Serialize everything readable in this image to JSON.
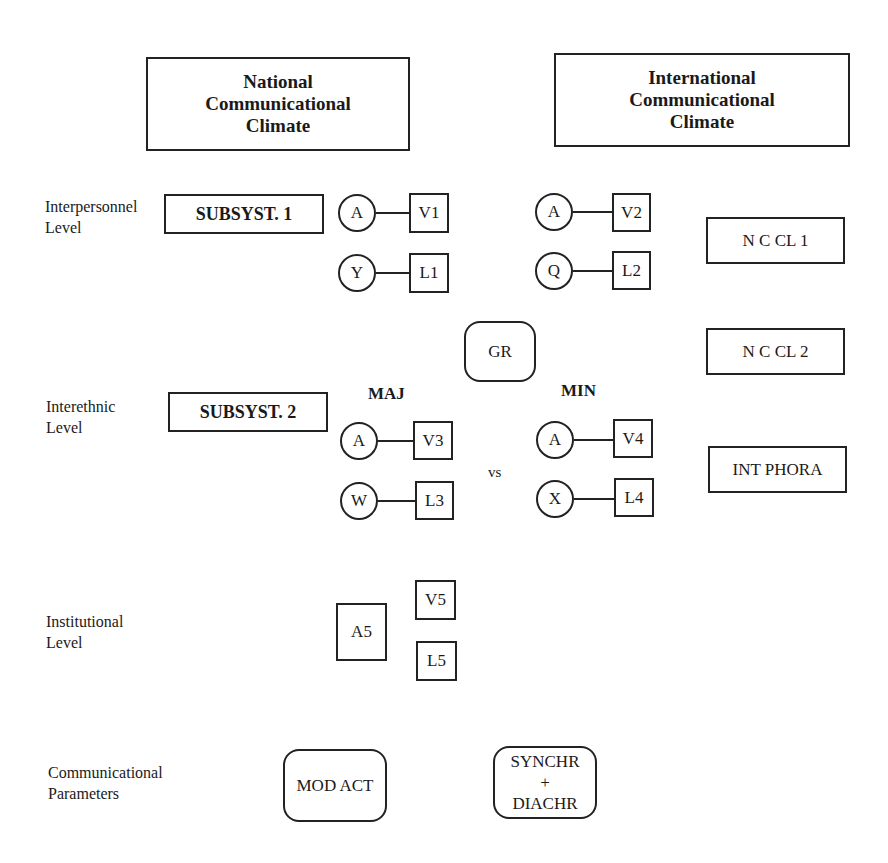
{
  "headers": {
    "national": "National\nCommunicational\nClimate",
    "international": "International\nCommunicational\nClimate"
  },
  "levels": {
    "interpersonnel": "Interpersonnel\nLevel",
    "interethnic": "Interethnic\nLevel",
    "institutional": "Institutional\nLevel",
    "communicational": "Communicational\nParameters"
  },
  "subsystems": {
    "subsyst1": "SUBSYST. 1",
    "subsyst2": "SUBSYST. 2"
  },
  "interpersonnel": {
    "national": [
      {
        "circle": "A",
        "box": "V1"
      },
      {
        "circle": "Y",
        "box": "L1"
      }
    ],
    "international": [
      {
        "circle": "A",
        "box": "V2"
      },
      {
        "circle": "Q",
        "box": "L2"
      }
    ]
  },
  "gr": "GR",
  "climate_boxes": {
    "ncl1": "N C CL 1",
    "ncl2": "N C CL 2",
    "intphora": "INT PHORA"
  },
  "interethnic": {
    "maj_label": "MAJ",
    "min_label": "MIN",
    "vs": "vs",
    "maj": [
      {
        "circle": "A",
        "box": "V3"
      },
      {
        "circle": "W",
        "box": "L3"
      }
    ],
    "min": [
      {
        "circle": "A",
        "box": "V4"
      },
      {
        "circle": "X",
        "box": "L4"
      }
    ]
  },
  "institutional": {
    "a5": "A5",
    "v5": "V5",
    "l5": "L5"
  },
  "parameters": {
    "mod_act": "MOD ACT",
    "synchr": "SYNCHR\n+\nDIACHR"
  }
}
